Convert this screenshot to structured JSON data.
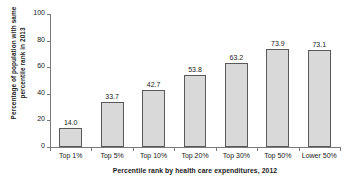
{
  "chart_data": {
    "type": "bar",
    "title": "",
    "categories": [
      "Top 1%",
      "Top 5%",
      "Top 10%",
      "Top 20%",
      "Top 30%",
      "Top 50%",
      "Lower 50%"
    ],
    "values": [
      14.0,
      33.7,
      42.7,
      53.8,
      63.2,
      73.9,
      73.1
    ],
    "value_labels": [
      "14.0",
      "33.7",
      "42.7",
      "53.8",
      "63.2",
      "73.9",
      "73.1"
    ],
    "xlabel": "Percentile rank by health care expenditures, 2012",
    "ylabel": "Percentage of population with same percentile rank in 2013",
    "ylabel_lines": [
      "Percentage of population with same",
      "percentile rank in 2013"
    ],
    "ylim": [
      0,
      100
    ],
    "yticks": [
      0,
      20,
      40,
      60,
      80,
      100
    ],
    "ytick_labels": [
      "0",
      "20",
      "40",
      "60",
      "80",
      "100"
    ],
    "grid": false,
    "legend": false,
    "bar_fill_color": "#d9d9d9",
    "bar_border_color": "#595959",
    "axis_color": "#7a7a7a",
    "background_color": "#ffffff"
  }
}
